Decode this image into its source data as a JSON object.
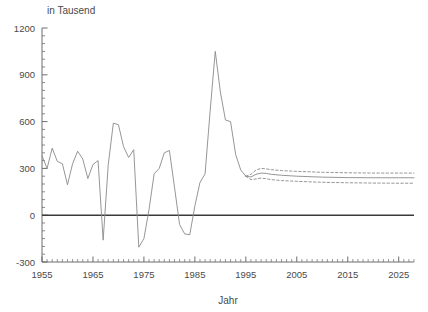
{
  "chart_data": {
    "type": "line",
    "title": "",
    "unit_label": "in Tausend",
    "xlabel": "Jahr",
    "ylabel": "",
    "xlim": [
      1955,
      2028
    ],
    "ylim": [
      -300,
      1200
    ],
    "x_major_ticks": [
      1955,
      1965,
      1975,
      1985,
      1995,
      2005,
      2015,
      2025
    ],
    "x_tick_labels": [
      "1955",
      "1965",
      "1975",
      "1985",
      "1995",
      "2005",
      "2015",
      "2025"
    ],
    "x_minor_step": 1,
    "y_major_ticks": [
      -300,
      0,
      300,
      600,
      900,
      1200
    ],
    "y_tick_labels": [
      "-300",
      "0",
      "300",
      "600",
      "900",
      "1200"
    ],
    "y_minor_step": 50,
    "grid": false,
    "zero_line": true,
    "legend_position": "none",
    "series": [
      {
        "name": "Wanderungssaldo (historisch)",
        "style": "solid",
        "color": "#8a8a8a",
        "x": [
          1955,
          1956,
          1957,
          1958,
          1959,
          1960,
          1961,
          1962,
          1963,
          1964,
          1965,
          1966,
          1967,
          1968,
          1969,
          1970,
          1971,
          1972,
          1973,
          1974,
          1975,
          1976,
          1977,
          1978,
          1979,
          1980,
          1981,
          1982,
          1983,
          1984,
          1985,
          1986,
          1987,
          1988,
          1989,
          1990,
          1991,
          1992,
          1993,
          1994,
          1995
        ],
        "values": [
          380,
          300,
          430,
          345,
          330,
          195,
          330,
          410,
          360,
          235,
          325,
          350,
          -160,
          325,
          590,
          580,
          440,
          370,
          420,
          -205,
          -150,
          35,
          265,
          300,
          400,
          415,
          180,
          -60,
          -120,
          -125,
          60,
          210,
          265,
          670,
          1050,
          790,
          610,
          600,
          390,
          290,
          250
        ]
      },
      {
        "name": "Vorausberechnung (mittlere Variante)",
        "style": "solid",
        "color": "#8a8a8a",
        "x": [
          1995,
          1996,
          1997,
          1998,
          1999,
          2000,
          2002,
          2005,
          2010,
          2015,
          2020,
          2025,
          2028
        ],
        "values": [
          250,
          245,
          262,
          270,
          268,
          262,
          256,
          250,
          244,
          241,
          240,
          240,
          240
        ]
      },
      {
        "name": "Vorausberechnung (obere Variante)",
        "style": "dashed",
        "color": "#8a8a8a",
        "x": [
          1995,
          1996,
          1997,
          1998,
          1999,
          2000,
          2002,
          2005,
          2010,
          2015,
          2020,
          2025,
          2028
        ],
        "values": [
          250,
          262,
          290,
          300,
          297,
          292,
          286,
          281,
          275,
          272,
          270,
          270,
          270
        ]
      },
      {
        "name": "Vorausberechnung (untere Variante)",
        "style": "dashed",
        "color": "#8a8a8a",
        "x": [
          1995,
          1996,
          1997,
          1998,
          1999,
          2000,
          2002,
          2005,
          2010,
          2015,
          2020,
          2025,
          2028
        ],
        "values": [
          250,
          228,
          232,
          238,
          234,
          228,
          222,
          217,
          211,
          208,
          206,
          205,
          205
        ]
      }
    ]
  }
}
